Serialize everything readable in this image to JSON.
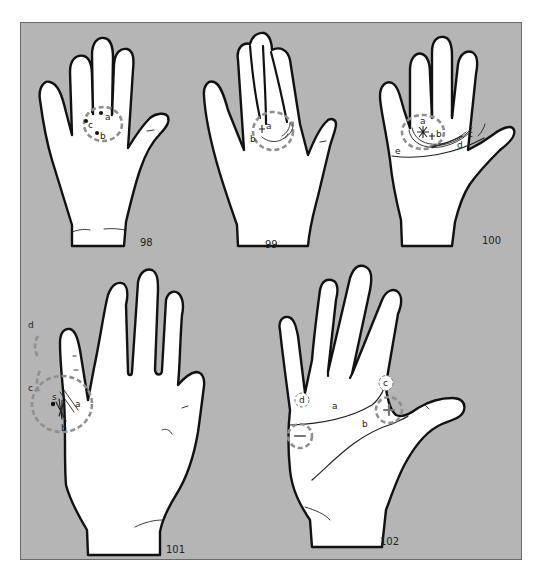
{
  "figure": {
    "background_color": "#ffffff",
    "panel_color": "#b5b5b5",
    "outline_color": "#111111",
    "marker_ring_color": "#8f8f8f"
  },
  "hands": [
    {
      "id": "98",
      "caption": "98",
      "labels": {
        "a": "a",
        "b": "b",
        "c": "c"
      },
      "markers": [
        "dot",
        "dot",
        "dot",
        "dashed-circle"
      ]
    },
    {
      "id": "99",
      "caption": "99",
      "labels": {
        "a": "a",
        "b": "b"
      },
      "markers": [
        "cross",
        "arc-lines",
        "dashed-circle"
      ]
    },
    {
      "id": "100",
      "caption": "100",
      "labels": {
        "a": "a",
        "b": "b",
        "c": "c",
        "d": "d",
        "e": "e"
      },
      "markers": [
        "star",
        "cross",
        "arc-lines",
        "dashed-circle"
      ]
    },
    {
      "id": "101",
      "caption": "101",
      "labels": {
        "a": "a",
        "b": "b",
        "c": "c",
        "d": "d",
        "s": "s"
      },
      "markers": [
        "dot",
        "hatched-lines",
        "dashed-circle",
        "dashed-arc-c",
        "dashed-arc-d"
      ]
    },
    {
      "id": "102",
      "caption": "102",
      "labels": {
        "a": "a",
        "b": "b",
        "c": "c",
        "d": "d",
        "plus": "+",
        "minus": "−"
      },
      "markers": [
        "plus-circle",
        "minus-circle",
        "small-circle-c",
        "small-circle-d"
      ]
    }
  ]
}
